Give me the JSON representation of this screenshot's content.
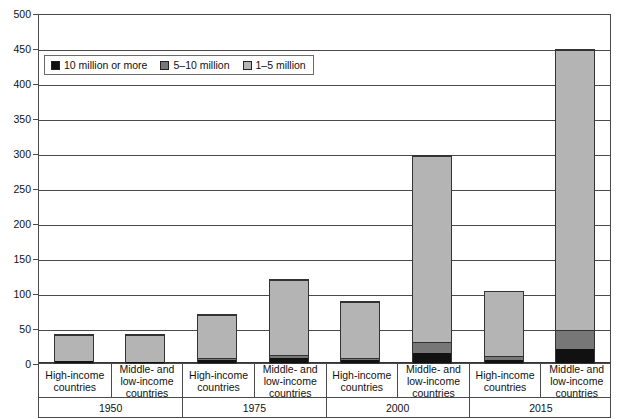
{
  "chart_data": {
    "type": "bar",
    "stacked": true,
    "title": "",
    "xlabel": "",
    "ylabel": "",
    "ylim": [
      0,
      500
    ],
    "ytick_step": 50,
    "yticks": [
      "500",
      "450",
      "400",
      "350",
      "300",
      "250",
      "200",
      "150",
      "100",
      "50",
      "0"
    ],
    "grid": true,
    "legend_position": "upper-left-inside",
    "series": [
      {
        "name": "10 million or more",
        "color": "#111111",
        "values": [
          3,
          2,
          4,
          7,
          5,
          15,
          5,
          20
        ]
      },
      {
        "name": "5–10 million",
        "color": "#777777",
        "values": [
          0,
          0,
          3,
          4,
          3,
          15,
          5,
          28
        ]
      },
      {
        "name": "1–5 million",
        "color": "#b4b4b4",
        "values": [
          40,
          41,
          65,
          111,
          82,
          268,
          95,
          402
        ]
      }
    ],
    "categories": [
      "High-income countries",
      "Middle- and low-income countries",
      "High-income countries",
      "Middle- and low-income countries",
      "High-income countries",
      "Middle- and low-income countries",
      "High-income countries",
      "Middle- and low-income countries"
    ],
    "totals": [
      43,
      43,
      72,
      122,
      90,
      298,
      105,
      450
    ],
    "groups": [
      {
        "year": "1950",
        "categories": [
          "High-income countries",
          "Middle- and low-income countries"
        ]
      },
      {
        "year": "1975",
        "categories": [
          "High-income countries",
          "Middle- and low-income countries"
        ]
      },
      {
        "year": "2000",
        "categories": [
          "High-income countries",
          "Middle- and low-income countries"
        ]
      },
      {
        "year": "2015",
        "categories": [
          "High-income countries",
          "Middle- and low-income countries"
        ]
      }
    ]
  },
  "legend": {
    "items": [
      {
        "label": "10 million or more"
      },
      {
        "label": "5–10 million"
      },
      {
        "label": "1–5 million"
      }
    ]
  },
  "axis": {
    "y_ticks": [
      "500",
      "450",
      "400",
      "350",
      "300",
      "250",
      "200",
      "150",
      "100",
      "50",
      "0"
    ]
  },
  "categories_labels": [
    "High-income countries",
    "Middle- and low-income countries",
    "High-income countries",
    "Middle- and low-income countries",
    "High-income countries",
    "Middle- and low-income countries",
    "High-income countries",
    "Middle- and low-income countries"
  ],
  "year_labels": [
    "1950",
    "1975",
    "2000",
    "2015"
  ]
}
